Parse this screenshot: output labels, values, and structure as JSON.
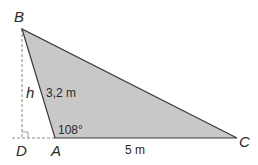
{
  "figure": {
    "points": {
      "B": {
        "label": "B",
        "x": 22,
        "y": 29
      },
      "A": {
        "label": "A",
        "x": 55,
        "y": 138
      },
      "C": {
        "label": "C",
        "x": 237,
        "y": 138
      },
      "D": {
        "label": "D",
        "x": 22,
        "y": 138
      }
    },
    "labels": {
      "height": "h",
      "side_ab": "3,2 m",
      "angle_a": "108°",
      "side_ac": "5 m"
    },
    "colors": {
      "fill": "#c8c8c8",
      "stroke": "#3a3a3a",
      "dashed": "#8a8a8a",
      "text": "#2a2a2a"
    }
  }
}
